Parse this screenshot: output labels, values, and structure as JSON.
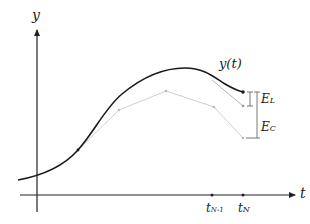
{
  "diagram": {
    "axes": {
      "y_label": "y",
      "x_label": "t"
    },
    "curve_label": "y(t)",
    "ticks": [
      {
        "base": "t",
        "sub": "N-1"
      },
      {
        "base": "t",
        "sub": "N"
      }
    ],
    "errors": [
      {
        "base": "E",
        "sub": "L"
      },
      {
        "base": "E",
        "sub": "C"
      }
    ],
    "colors": {
      "axis": "#222222",
      "exact_curve": "#1a1a1a",
      "approx_lines": "#c8c8c8",
      "bracket": "#555555"
    }
  }
}
